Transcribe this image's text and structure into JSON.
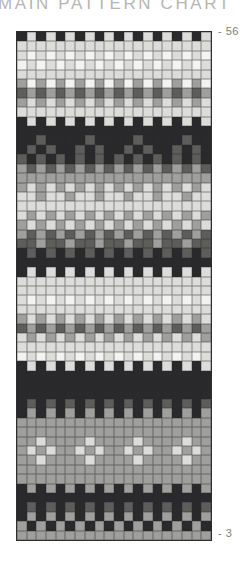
{
  "page": {
    "title": "MAIN PATTERN CHART",
    "top_row_label": "- 56",
    "bottom_row_label": "- 3"
  },
  "chart_data": {
    "type": "heatmap",
    "title": "MAIN PATTERN CHART",
    "columns": 20,
    "row_numbers_top_to_bottom": [
      56,
      3
    ],
    "labeled_rows": [
      56,
      3
    ],
    "grid_on": true,
    "grid_line_color": "#3a3a3a",
    "palette": {
      "K": "#2a2a2c",
      "D": "#5d5d5b",
      "M": "#9f9f9d",
      "L": "#dcdcda",
      "W": "#f3f3f1"
    },
    "palette_legend": {
      "K": "near-black",
      "D": "dark-gray",
      "M": "medium-gray",
      "L": "light-gray",
      "W": "off-white"
    },
    "rows": [
      {
        "row": 56,
        "cells": "KLKLKLKLKLKLKLKLKLKL"
      },
      {
        "row": 55,
        "cells": "LLLLLLLLLLLLLLLLLLLL"
      },
      {
        "row": 54,
        "cells": "LWLWLWLWLWLWLWLWLWLW"
      },
      {
        "row": 53,
        "cells": "WLWLWLWLWLWLWLWLWLWL"
      },
      {
        "row": 52,
        "cells": "LLLLLLLLLLLLLLLLLLLL"
      },
      {
        "row": 51,
        "cells": "MWMWMWMWMWMWMWMWMWMW"
      },
      {
        "row": 50,
        "cells": "DMDMDMDMDMDMDMDMDMDM"
      },
      {
        "row": 49,
        "cells": "MLMLMLMLMLMLMLMLMLML"
      },
      {
        "row": 48,
        "cells": "LLLLLLLLLLLLLLLLLLLL"
      },
      {
        "row": 47,
        "cells": "KLKLKLKLKLKLKLKLKLKL"
      },
      {
        "row": 46,
        "cells": "KKKKKKKKKKKKKKKKKKKK"
      },
      {
        "row": 45,
        "cells": "KKDKKKKDKKKKDKKKKDKK"
      },
      {
        "row": 44,
        "cells": "KDKDKKDKDKKDKDKKDKDK"
      },
      {
        "row": 43,
        "cells": "DKDKDKDKDKDKDKDKDKDK"
      },
      {
        "row": 42,
        "cells": "MDMDMDMDMDMDMDMDMDMD"
      },
      {
        "row": 41,
        "cells": "MMMMMMMMMMMMMMMMMMMM"
      },
      {
        "row": 40,
        "cells": "MLMLMLMLMLMLMLMLMLML"
      },
      {
        "row": 39,
        "cells": "LLMLLMLLMLLMLLMLLMLL"
      },
      {
        "row": 38,
        "cells": "LLLLLLLLLLLLLLLLLLLL"
      },
      {
        "row": 37,
        "cells": "LMLMLMLMLMLMLMLMLMLM"
      },
      {
        "row": 36,
        "cells": "MLMLMLMLMLMLMLMLMLML"
      },
      {
        "row": 35,
        "cells": "MDMDMDMDMDMDMDMDMDMD"
      },
      {
        "row": 34,
        "cells": "DDMDDMDDMDDMDDMDDMDD"
      },
      {
        "row": 33,
        "cells": "KDKDKDKDKDKDKDKDKDKD"
      },
      {
        "row": 32,
        "cells": "KKKKKKKKKKKKKKKKKKKK"
      },
      {
        "row": 31,
        "cells": "KLKLKLKLKLKLKLKLKLKL"
      },
      {
        "row": 30,
        "cells": "LLLLLLLLLLLLLLLLLLLL"
      },
      {
        "row": 29,
        "cells": "LLLLLLLLLLLLLLLLLLLL"
      },
      {
        "row": 28,
        "cells": "LWLWLWLWLWLWLWLWLWLW"
      },
      {
        "row": 27,
        "cells": "LLLLLLLLLLLLLLLLLLLL"
      },
      {
        "row": 26,
        "cells": "MLMLMLMLMLMLMLMLMLML"
      },
      {
        "row": 25,
        "cells": "DMDMDMDMDMDMDMDMDMDM"
      },
      {
        "row": 24,
        "cells": "LMLMLMLMLMLMLMLMLMLM"
      },
      {
        "row": 23,
        "cells": "LLLLLLLLLLLLLLLLLLLL"
      },
      {
        "row": 22,
        "cells": "WLWLWLWLWLWLWLWLWLWL"
      },
      {
        "row": 21,
        "cells": "KLKLKLKLKLKLKLKLKLKL"
      },
      {
        "row": 20,
        "cells": "KKKKKKKKKKKKKKKKKKKK"
      },
      {
        "row": 19,
        "cells": "KKKKKKKKKKKKKKKKKKKK"
      },
      {
        "row": 18,
        "cells": "KKKKKKKKKKKKKKKKKKKK"
      },
      {
        "row": 17,
        "cells": "KDKDKDKDKDKDKDKDKDKD"
      },
      {
        "row": 16,
        "cells": "KMKMKMKMKMKMKMKMKMKM"
      },
      {
        "row": 15,
        "cells": "MMMMMMMMMMMMMMMMMMMM"
      },
      {
        "row": 14,
        "cells": "MMMMMMMMMMMMMMMMMMMM"
      },
      {
        "row": 13,
        "cells": "MMLMMMMLMMMMLMMMMLMM"
      },
      {
        "row": 12,
        "cells": "MLMLMMLMLMMLMLMMLMLM"
      },
      {
        "row": 11,
        "cells": "MMLMMMMLMMMMLMMMMLMM"
      },
      {
        "row": 10,
        "cells": "MMMMMMMMMMMMMMMMMMMM"
      },
      {
        "row": 9,
        "cells": "MMMMMMMMMMMMMMMMMMMM"
      },
      {
        "row": 8,
        "cells": "KMKMKMKMKMKMKMKMKMKM"
      },
      {
        "row": 7,
        "cells": "KKKKKKKKKKKKKKKKKKKK"
      },
      {
        "row": 6,
        "cells": "KDKDKDKDKDKDKDKDKDKD"
      },
      {
        "row": 5,
        "cells": "KMKMKMKMKMKMKMKMKMKM"
      },
      {
        "row": 4,
        "cells": "MKMKMKMKMKMKMKMKMKMK"
      },
      {
        "row": 3,
        "cells": "MMMMMMMMMMMMMMMMMMMM"
      }
    ]
  }
}
